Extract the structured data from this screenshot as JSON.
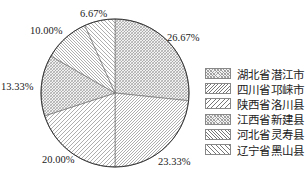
{
  "chart_data": {
    "type": "pie",
    "title": "",
    "categories": [
      "湖北省潜江市",
      "四川省邛崃市",
      "陕西省洛川县",
      "江西省新建县",
      "河北省灵寿县",
      "辽宁省黑山县"
    ],
    "values": [
      26.67,
      23.33,
      20.0,
      13.33,
      10.0,
      6.67
    ],
    "labels": [
      "26.67%",
      "23.33%",
      "20.00%",
      "13.33%",
      "10.00%",
      "6.67%"
    ],
    "start_angle": "12 o'clock",
    "direction": "clockwise",
    "legend_position": "right",
    "fill_style": "hatched patterns, grayscale"
  },
  "legend": {
    "items": [
      {
        "label": "湖北省潜江市",
        "pattern": "dense-cross"
      },
      {
        "label": "四川省邛崃市",
        "pattern": "diag-right-dense"
      },
      {
        "label": "陕西省洛川县",
        "pattern": "diag-right-sparse"
      },
      {
        "label": "江西省新建县",
        "pattern": "dense-cross"
      },
      {
        "label": "河北省灵寿县",
        "pattern": "diag-left-dense"
      },
      {
        "label": "辽宁省黑山县",
        "pattern": "diag-left-sparse"
      }
    ]
  }
}
